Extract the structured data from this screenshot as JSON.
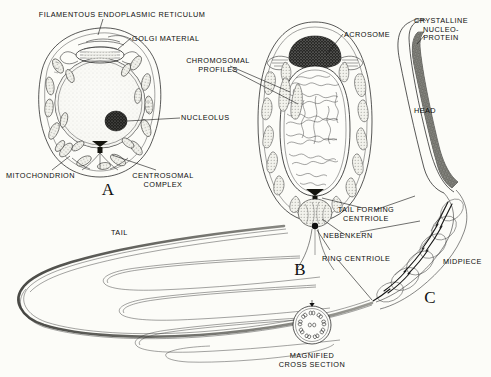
{
  "figure": {
    "title_visible": false,
    "background_color": "#fcfcf8",
    "ink_color": "#111111",
    "type": "biological-diagram"
  },
  "panels": [
    {
      "id": "panel-a",
      "letter": "A",
      "x": 108,
      "y": 188
    },
    {
      "id": "panel-b",
      "letter": "B",
      "x": 300,
      "y": 268
    },
    {
      "id": "panel-c",
      "letter": "C",
      "x": 430,
      "y": 296
    }
  ],
  "labels": [
    {
      "name": "filamentous-endoplasmic-reticulum",
      "text": "FILAMENTOUS ENDOPLASMIC RETICULUM",
      "x": 122,
      "y": 11,
      "align": "c"
    },
    {
      "name": "golgi-material",
      "text": "GOLGI MATERIAL",
      "x": 132,
      "y": 35,
      "align": "l"
    },
    {
      "name": "chromosomal-profiles",
      "text": "CHROMOSOMAL\nPROFILES",
      "x": 218,
      "y": 57,
      "align": "c"
    },
    {
      "name": "nucleolus",
      "text": "NUCLEOLUS",
      "x": 181,
      "y": 114,
      "align": "l"
    },
    {
      "name": "mitochondrion",
      "text": "MITOCHONDRION",
      "x": 6,
      "y": 172,
      "align": "l"
    },
    {
      "name": "centrosomal-complex",
      "text": "CENTROSOMAL\nCOMPLEX",
      "x": 163,
      "y": 172,
      "align": "c"
    },
    {
      "name": "acrosome",
      "text": "ACROSOME",
      "x": 344,
      "y": 31,
      "align": "l"
    },
    {
      "name": "crystalline-nucleoprotein",
      "text": "CRYSTALLINE\nNUCLEO-\nPROTEIN",
      "x": 441,
      "y": 17,
      "align": "c"
    },
    {
      "name": "head",
      "text": "HEAD",
      "x": 414,
      "y": 107,
      "align": "l"
    },
    {
      "name": "tail",
      "text": "TAIL",
      "x": 111,
      "y": 229,
      "align": "l"
    },
    {
      "name": "tail-forming-centriole",
      "text": "TAIL FORMING\nCENTRIOLE",
      "x": 366,
      "y": 206,
      "align": "c"
    },
    {
      "name": "nebenkern",
      "text": "NEBENKERN",
      "x": 348,
      "y": 232,
      "align": "c"
    },
    {
      "name": "ring-centriole",
      "text": "RING CENTRIOLE",
      "x": 322,
      "y": 255,
      "align": "l"
    },
    {
      "name": "midpiece",
      "text": "MIDPIECE",
      "x": 443,
      "y": 258,
      "align": "l"
    },
    {
      "name": "magnified-cross-section",
      "text": "MAGNIFIED\nCROSS SECTION",
      "x": 312,
      "y": 352,
      "align": "c"
    }
  ],
  "structures": {
    "cell_a": {
      "name": "spermatocyte",
      "center_x": 100,
      "center_y": 105,
      "features": [
        "cell-membrane",
        "nucleus",
        "nucleolus",
        "mitochondria",
        "golgi-material",
        "endoplasmic-reticulum",
        "centrosomal-complex"
      ]
    },
    "cell_b": {
      "name": "spermatid",
      "center_x": 315,
      "center_y": 125,
      "features": [
        "acrosome",
        "nucleus",
        "chromosomal-profiles",
        "nebenkern",
        "tail-forming-centriole",
        "ring-centriole"
      ]
    },
    "cell_c": {
      "name": "mature-spermatozoon",
      "features": [
        "head",
        "crystalline-nucleoprotein",
        "midpiece",
        "tail",
        "magnified-cross-section"
      ]
    },
    "cross_section": {
      "center_x": 312,
      "center_y": 325,
      "radius": 19,
      "pattern": "9+2 axoneme",
      "outer_doublets": 9,
      "central_pair": 2
    }
  }
}
